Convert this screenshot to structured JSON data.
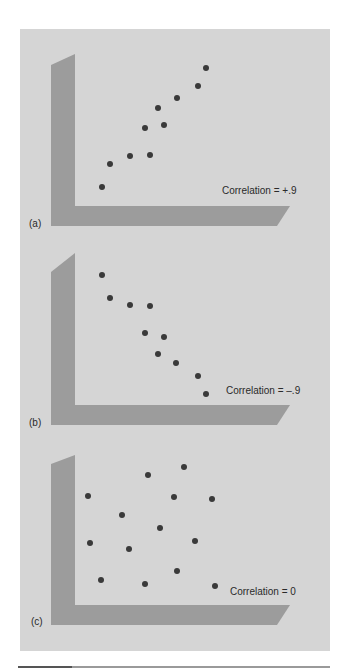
{
  "figure": {
    "background_color": "#d5d5d5",
    "axis_color": "#9c9c9c",
    "dot_color": "#3a3a3a"
  },
  "chart_data": [
    {
      "type": "scatter",
      "panel_label": "(a)",
      "annotation": "Correlation = +.9",
      "correlation": 0.9,
      "xlabel": "",
      "ylabel": "",
      "grid": false,
      "points_px": [
        [
          102,
          187
        ],
        [
          110,
          164
        ],
        [
          130,
          156
        ],
        [
          150,
          155
        ],
        [
          145,
          128
        ],
        [
          164,
          125
        ],
        [
          158,
          108
        ],
        [
          177,
          98
        ],
        [
          198,
          86
        ],
        [
          206,
          68
        ]
      ],
      "x": [
        1,
        2,
        3.5,
        5,
        4.5,
        6,
        5.5,
        7,
        8.5,
        9
      ],
      "y": [
        1,
        2.5,
        3,
        3,
        5,
        5.2,
        6.2,
        6.8,
        7.5,
        8.5
      ]
    },
    {
      "type": "scatter",
      "panel_label": "(b)",
      "annotation": "Correlation = –.9",
      "correlation": -0.9,
      "xlabel": "",
      "ylabel": "",
      "grid": false,
      "points_px": [
        [
          102,
          275
        ],
        [
          110,
          298
        ],
        [
          130,
          305
        ],
        [
          150,
          306
        ],
        [
          145,
          333
        ],
        [
          164,
          337
        ],
        [
          158,
          354
        ],
        [
          176,
          363
        ],
        [
          198,
          376
        ],
        [
          206,
          394
        ]
      ],
      "x": [
        1,
        2,
        3.5,
        5,
        4.5,
        6,
        5.5,
        7,
        8.5,
        9
      ],
      "y": [
        8.5,
        7.5,
        7,
        7,
        5.2,
        5,
        3.8,
        3.2,
        2.5,
        1.3
      ]
    },
    {
      "type": "scatter",
      "panel_label": "(c)",
      "annotation": "Correlation = 0",
      "correlation": 0,
      "xlabel": "",
      "ylabel": "",
      "grid": false,
      "points_px": [
        [
          184,
          467
        ],
        [
          148,
          475
        ],
        [
          88,
          496
        ],
        [
          174,
          497
        ],
        [
          212,
          499
        ],
        [
          122,
          515
        ],
        [
          160,
          528
        ],
        [
          90,
          543
        ],
        [
          195,
          541
        ],
        [
          129,
          549
        ],
        [
          177,
          571
        ],
        [
          101,
          580
        ],
        [
          145,
          584
        ],
        [
          215,
          586
        ]
      ],
      "x": [
        7.5,
        5,
        1,
        6.8,
        9.3,
        3.5,
        6,
        1.2,
        8.3,
        3.9,
        7,
        1.9,
        4.9,
        9.5
      ],
      "y": [
        8.3,
        7.8,
        6.5,
        6.4,
        6.3,
        5.3,
        4.5,
        3.6,
        3.7,
        3.2,
        1.9,
        1.3,
        1.1,
        1
      ]
    }
  ]
}
